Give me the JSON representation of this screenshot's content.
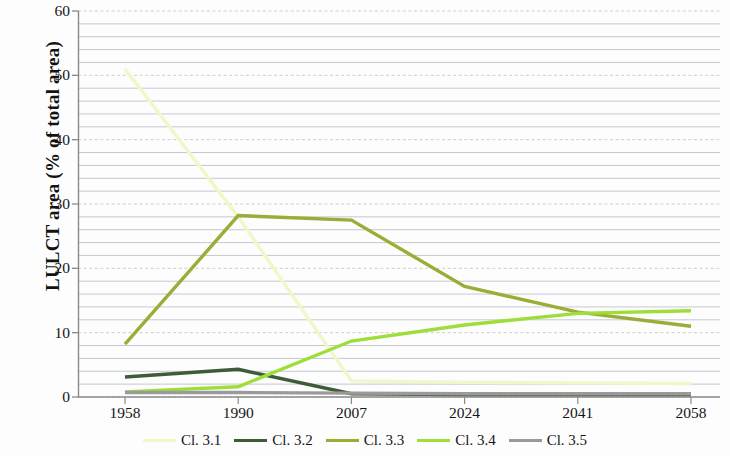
{
  "chart_data": {
    "type": "line",
    "title": "",
    "xlabel": "",
    "ylabel": "LULCT area (% of total area)",
    "categories": [
      "1958",
      "1990",
      "2007",
      "2024",
      "2041",
      "2058"
    ],
    "ylim": [
      0,
      60
    ],
    "y_ticks": [
      0,
      10,
      20,
      30,
      40,
      50,
      60
    ],
    "y_minor_step": 2,
    "grid": true,
    "legend_position": "bottom",
    "series": [
      {
        "name": "Cl. 3.1",
        "color": "#f1f7c8",
        "values": [
          51.0,
          28.0,
          2.5,
          2.3,
          2.2,
          2.1
        ]
      },
      {
        "name": "Cl. 3.2",
        "color": "#3f5c38",
        "values": [
          3.1,
          4.3,
          0.5,
          0.4,
          0.4,
          0.4
        ]
      },
      {
        "name": "Cl. 3.3",
        "color": "#9aad36",
        "values": [
          8.2,
          28.2,
          27.5,
          17.2,
          13.2,
          11.0
        ]
      },
      {
        "name": "Cl. 3.4",
        "color": "#9ede3a",
        "values": [
          0.8,
          1.6,
          8.7,
          11.2,
          13.0,
          13.4
        ]
      },
      {
        "name": "Cl. 3.5",
        "color": "#9a9a9a",
        "values": [
          0.7,
          0.7,
          0.6,
          0.5,
          0.5,
          0.5
        ]
      }
    ]
  },
  "axis": {
    "y_title": "LULCT area (% of total area)",
    "y_tick_labels": [
      "60",
      "50",
      "40",
      "30",
      "20",
      "10",
      "0"
    ],
    "x_tick_labels": [
      "1958",
      "1990",
      "2007",
      "2024",
      "2041",
      "2058"
    ]
  },
  "legend": {
    "items": [
      {
        "label": "Cl. 3.1",
        "color": "#f1f7c8"
      },
      {
        "label": "Cl. 3.2",
        "color": "#3f5c38"
      },
      {
        "label": "Cl. 3.3",
        "color": "#9aad36"
      },
      {
        "label": "Cl. 3.4",
        "color": "#9ede3a"
      },
      {
        "label": "Cl. 3.5",
        "color": "#9a9a9a"
      }
    ]
  },
  "style": {
    "major_gridline_color": "#cdcdcd",
    "minor_gridline_color": "#b9bfc6",
    "axis_color": "#8a8a8a"
  }
}
